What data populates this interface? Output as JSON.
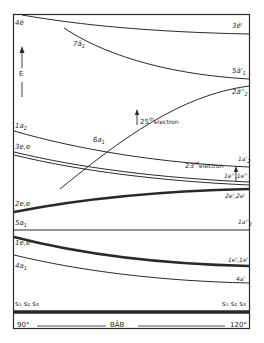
{
  "diagram": {
    "type": "correlation-diagram",
    "energy_axis_label": "E",
    "x_axis": {
      "left_label": "90°",
      "right_label": "120°",
      "center_label": "B̂AB"
    },
    "baseline_labels": {
      "left": "s1 s2 s3",
      "right": "s1 s2 s3"
    },
    "levels": [
      {
        "left": "4ē",
        "right": "3ē'"
      },
      {
        "left": "7ā1",
        "right": "5ā'1"
      },
      {
        "left": "6a1",
        "right": "2ā''2"
      },
      {
        "left": "1a2",
        "right": "1a'2"
      },
      {
        "left": "3e,e",
        "right": "1e'',1e''"
      },
      {
        "left": "2e,e",
        "right": "2e',2e'"
      },
      {
        "left": "5a1",
        "right": "1a''2"
      },
      {
        "left": "1e,e",
        "right": "1e',1e'"
      },
      {
        "left": "4a1",
        "right": "4a'"
      }
    ],
    "annotations": [
      {
        "text": "25th electron",
        "marker": "up-arrow"
      },
      {
        "text": "23rd electron",
        "marker": "up-arrow"
      }
    ]
  },
  "labels": {
    "l_4e": "4ē",
    "l_7a1": "7ā",
    "l_7a1_sub": "1",
    "l_1a2": "1a",
    "l_1a2_sub": "2",
    "l_3ee": "3e,e",
    "l_2ee": "2e,e",
    "l_5a1": "5a",
    "l_5a1_sub": "1",
    "l_1ee": "1e,e",
    "l_4a1": "4a",
    "l_4a1_sub": "1",
    "l_6a1": "6a",
    "l_6a1_sub": "1",
    "r_3e": "3ē'",
    "r_5a1": "5ā'",
    "r_5a1_sub": "1",
    "r_2a2": "2ā''",
    "r_2a2_sub": "2",
    "r_1a2p": "1a'",
    "r_1a2p_sub": "2",
    "r_1epp": "1e'',1e''",
    "r_2ep": "2e',2e'",
    "r_1a2pp": "1a''",
    "r_1a2pp_sub": "2",
    "r_1ep": "1e',1e'",
    "r_4ap": "4a'",
    "e25_num": "25",
    "e25_sup": "th",
    "e25_word": "electron",
    "e23_num": "23",
    "e23_sup": "rd",
    "e23_word": "electron",
    "energy": "E",
    "s_left": "s₁ s₂ s₃",
    "s_right": "s₁ s₂ s₃",
    "deg_left": "90°",
    "deg_right": "120°",
    "bab": "BÂB"
  }
}
